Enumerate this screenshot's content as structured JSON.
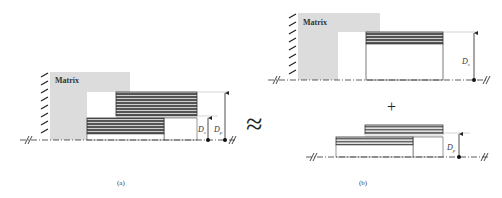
{
  "figure": {
    "panel_a": {
      "caption": "(a)",
      "matrix_label": "Matrix",
      "dim_labels": {
        "short": "D",
        "short_sub": "s",
        "long": "D",
        "long_sub": "p"
      }
    },
    "approx_symbol": "≈",
    "panel_b": {
      "caption": "(b)",
      "top": {
        "matrix_label": "Matrix",
        "dim_label": "D",
        "dim_sub": "s"
      },
      "plus_symbol": "+",
      "bottom": {
        "dim_label": "D",
        "dim_sub": "p"
      }
    },
    "colors": {
      "matrix_fill": "#dcdcdc",
      "stripe_dark": "#5a5a5a",
      "stripe_light": "#cfcfcf",
      "line": "#333333",
      "guide": "#bbbbbb"
    }
  }
}
